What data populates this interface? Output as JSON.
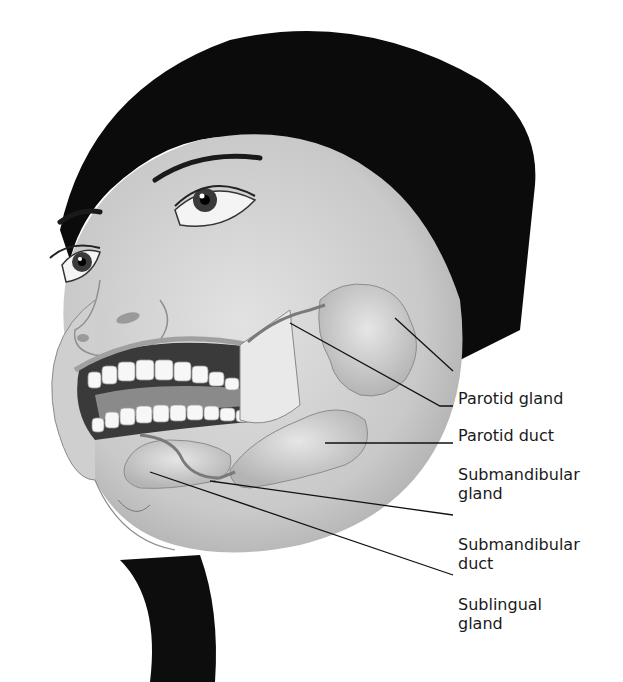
{
  "figure": {
    "labels": [
      {
        "id": "parotid-gland",
        "lines": [
          "Parotid gland"
        ],
        "x": 458,
        "y": 360,
        "leader": {
          "x1": 395,
          "y1": 318,
          "x2": 453,
          "y2": 371
        }
      },
      {
        "id": "parotid-duct",
        "lines": [
          "Parotid duct"
        ],
        "x": 458,
        "y": 396,
        "leader": {
          "x1": 290,
          "y1": 323,
          "x2": 453,
          "y2": 406
        }
      },
      {
        "id": "submandibular-gland",
        "lines": [
          "Submandibular",
          "gland"
        ],
        "x": 458,
        "y": 434,
        "leader": {
          "x1": 325,
          "y1": 443,
          "x2": 453,
          "y2": 443
        }
      },
      {
        "id": "submandibular-duct",
        "lines": [
          "Submandibular",
          "duct"
        ],
        "x": 458,
        "y": 505,
        "leader": {
          "x1": 210,
          "y1": 481,
          "x2": 453,
          "y2": 515
        }
      },
      {
        "id": "sublingual-gland",
        "lines": [
          "Sublingual",
          "gland"
        ],
        "x": 458,
        "y": 565,
        "leader": {
          "x1": 150,
          "y1": 472,
          "x2": 453,
          "y2": 575
        }
      }
    ]
  }
}
